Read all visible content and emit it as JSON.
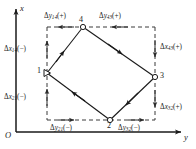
{
  "figure": {
    "axes": {
      "x_label": "x",
      "y_label": "y",
      "origin_label": "O"
    },
    "nodes": [
      {
        "id": "1",
        "label": "1",
        "marker": "open-triangle"
      },
      {
        "id": "2",
        "label": "2",
        "marker": "open-circle"
      },
      {
        "id": "3",
        "label": "3",
        "marker": "open-circle"
      },
      {
        "id": "4",
        "label": "4",
        "marker": "open-circle"
      }
    ],
    "increments": {
      "dy14": {
        "delta": "Δ",
        "sym": "y",
        "sub": "14",
        "sign": "(+)"
      },
      "dy43": {
        "delta": "Δ",
        "sym": "y",
        "sub": "43",
        "sign": "(+)"
      },
      "dx14": {
        "delta": "Δ",
        "sym": "x",
        "sub": "14",
        "sign": "(−)"
      },
      "dx21": {
        "delta": "Δ",
        "sym": "x",
        "sub": "21",
        "sign": "(−)"
      },
      "dx43": {
        "delta": "Δ",
        "sym": "x",
        "sub": "43",
        "sign": "(+)"
      },
      "dx32": {
        "delta": "Δ",
        "sym": "x",
        "sub": "32",
        "sign": "(+)"
      },
      "dy21": {
        "delta": "Δ",
        "sym": "y",
        "sub": "21",
        "sign": "(−)"
      },
      "dy32": {
        "delta": "Δ",
        "sym": "y",
        "sub": "32",
        "sign": "(−)"
      }
    },
    "colors": {
      "line": "#1a1a1a",
      "dashed": "#3a3a3a",
      "background": "#ffffff"
    }
  }
}
